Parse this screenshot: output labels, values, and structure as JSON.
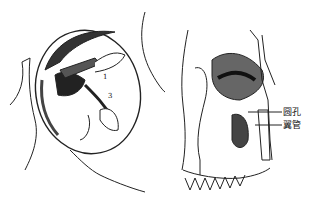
{
  "figure": {
    "left_panel": {
      "description": "orbit viewed from front with structures",
      "numbers": [
        "1",
        "3"
      ]
    },
    "right_panel": {
      "description": "skull oblique view showing maxilla and pterygopalatine region",
      "labels": [
        {
          "text": "圆孔"
        },
        {
          "text": "翼管"
        }
      ]
    }
  }
}
